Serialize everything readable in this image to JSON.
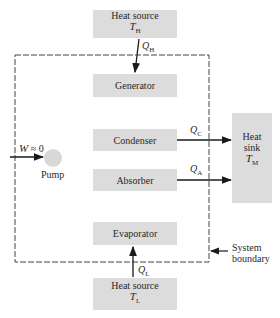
{
  "diagram": {
    "type": "absorption refrigeration system schematic",
    "colors": {
      "box_fill": "#dcdcdc",
      "line": "#1a1a1a",
      "pump_fill": "#d8d8d8"
    },
    "heat_source_top": {
      "line1": "Heat source",
      "symbol": "T",
      "subscript": "H"
    },
    "heat_source_bottom": {
      "line1": "Heat source",
      "symbol": "T",
      "subscript": "L"
    },
    "components": {
      "generator": "Generator",
      "condenser": "Condenser",
      "absorber": "Absorber",
      "evaporator": "Evaporator",
      "pump": "Pump"
    },
    "heat_sink": {
      "line1": "Heat",
      "line2": "sink",
      "symbol": "T",
      "subscript": "M"
    },
    "flows": {
      "q_h": {
        "symbol": "Q",
        "subscript": "H"
      },
      "q_c": {
        "symbol": "Q",
        "subscript": "C"
      },
      "q_a": {
        "symbol": "Q",
        "subscript": "A"
      },
      "q_l": {
        "symbol": "Q",
        "subscript": "L"
      },
      "work": {
        "symbol": "W",
        "relation": " ≈ 0"
      }
    },
    "boundary_label": {
      "line1": "System",
      "line2": "boundary"
    }
  }
}
